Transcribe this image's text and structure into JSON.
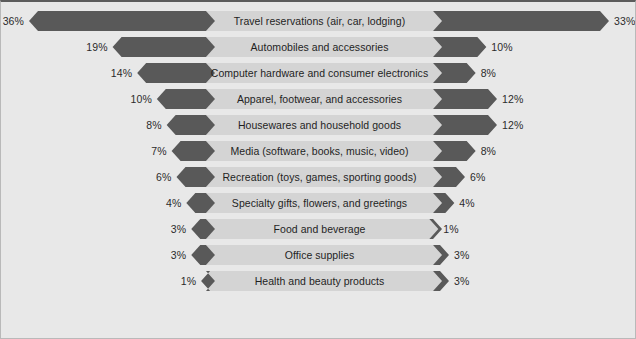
{
  "chart_data": {
    "type": "bar",
    "subtype": "tornado-butterfly-diverging",
    "title": "",
    "xlabel": "",
    "ylabel": "",
    "grid": false,
    "legend_position": "none",
    "axis_center_label": "",
    "value_suffix": "%",
    "categories": [
      "Travel reservations (air, car, lodging)",
      "Automobiles and accessories",
      "Computer hardware and consumer electronics",
      "Apparel, footwear, and accessories",
      "Housewares and household goods",
      "Media (software, books, music, video)",
      "Recreation (toys, games, sporting goods)",
      "Specialty gifts, flowers, and greetings",
      "Food and beverage",
      "Office supplies",
      "Health and beauty products"
    ],
    "series": [
      {
        "name": "left",
        "values": [
          36,
          19,
          14,
          10,
          8,
          7,
          6,
          4,
          3,
          3,
          1
        ],
        "labels": [
          "36%",
          "19%",
          "14%",
          "10%",
          "8%",
          "7%",
          "6%",
          "4%",
          "3%",
          "3%",
          "1%"
        ]
      },
      {
        "name": "right",
        "values": [
          33,
          10,
          8,
          12,
          12,
          8,
          6,
          4,
          1,
          3,
          3
        ],
        "labels": [
          "33%",
          "10%",
          "8%",
          "12%",
          "12%",
          "8%",
          "6%",
          "4%",
          "1%",
          "3%",
          "3%"
        ]
      }
    ],
    "xlim_left": [
      0,
      36
    ],
    "xlim_right": [
      0,
      33
    ],
    "colors": {
      "bar": "#595959",
      "center_band": "#d4d4d4",
      "background": "#e8e8e8",
      "text": "#1f1f1f",
      "border": "#5c5c5c"
    }
  },
  "rows": [
    {
      "category": "Travel reservations (air, car, lodging)",
      "left_label": "36%",
      "right_label": "33%",
      "left_value": 36,
      "right_value": 33
    },
    {
      "category": "Automobiles and accessories",
      "left_label": "19%",
      "right_label": "10%",
      "left_value": 19,
      "right_value": 10
    },
    {
      "category": "Computer hardware and consumer electronics",
      "left_label": "14%",
      "right_label": "8%",
      "left_value": 14,
      "right_value": 8
    },
    {
      "category": "Apparel, footwear, and accessories",
      "left_label": "10%",
      "right_label": "12%",
      "left_value": 10,
      "right_value": 12
    },
    {
      "category": "Housewares and household goods",
      "left_label": "8%",
      "right_label": "12%",
      "left_value": 8,
      "right_value": 12
    },
    {
      "category": "Media (software, books, music, video)",
      "left_label": "7%",
      "right_label": "8%",
      "left_value": 7,
      "right_value": 8
    },
    {
      "category": "Recreation (toys, games, sporting goods)",
      "left_label": "6%",
      "right_label": "6%",
      "left_value": 6,
      "right_value": 6
    },
    {
      "category": "Specialty gifts, flowers, and greetings",
      "left_label": "4%",
      "right_label": "4%",
      "left_value": 4,
      "right_value": 4
    },
    {
      "category": "Food and beverage",
      "left_label": "3%",
      "right_label": "1%",
      "left_value": 3,
      "right_value": 1
    },
    {
      "category": "Office supplies",
      "left_label": "3%",
      "right_label": "3%",
      "left_value": 3,
      "right_value": 3
    },
    {
      "category": "Health and beauty products",
      "left_label": "1%",
      "right_label": "3%",
      "left_value": 1,
      "right_value": 3
    }
  ]
}
